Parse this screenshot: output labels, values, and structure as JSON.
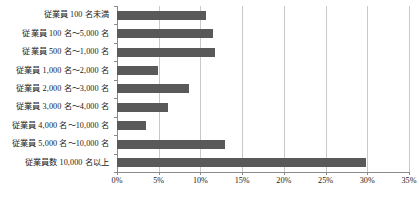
{
  "chart_data": {
    "type": "bar",
    "orientation": "horizontal",
    "title": "",
    "xlabel": "",
    "ylabel": "",
    "xlim": [
      0,
      35
    ],
    "xticks": [
      0,
      5,
      10,
      15,
      20,
      25,
      30,
      35
    ],
    "xtick_labels": [
      "0%",
      "5%",
      "10%",
      "15%",
      "20%",
      "25%",
      "30%",
      "35%"
    ],
    "grid": true,
    "legend": "none",
    "bar_color": "#595959",
    "gridline_color": "#c9c9c9",
    "axis_color": "#8a8a8a",
    "categories": [
      "従業員 100 名未満",
      "従業員 100 名〜5,000 名",
      "従業員 500 名〜1,000 名",
      "従業員 1,000 名〜2,000 名",
      "従業員 2,000 名〜3,000 名",
      "従業員 3,000 名〜4,000 名",
      "従業員 4,000 名〜10,000 名",
      "従業員 5,000 名〜10,000 名",
      "従業員数 10,000 名以上"
    ],
    "values": [
      10.7,
      11.5,
      11.7,
      4.9,
      8.6,
      6.1,
      3.5,
      13.0,
      29.8
    ],
    "value_labels": [
      "10.7%",
      "11.5%",
      "11.7%",
      "4.9%",
      "8.6%",
      "6.1%",
      "3.5%",
      "13.0%",
      "29.8%"
    ]
  }
}
